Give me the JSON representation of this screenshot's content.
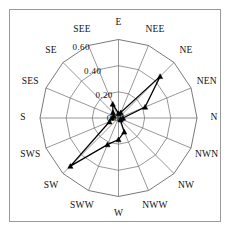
{
  "figure": {
    "background_color": "#ffffff",
    "frame_color": "#9a9a9a",
    "grid_color": "#6b6b6b",
    "series_color": "#000000"
  },
  "chart_data": {
    "type": "line",
    "subtype": "polar-radar",
    "title": "",
    "subtitle": "",
    "xlabel": "",
    "ylabel": "",
    "grid": true,
    "legend": null,
    "legend_position": "none",
    "angular_start_deg": 90,
    "angular_direction": "clockwise",
    "categories": [
      "E",
      "NEE",
      "NE",
      "NEN",
      "N",
      "NWN",
      "NW",
      "NWW",
      "W",
      "SWW",
      "SW",
      "SWS",
      "S",
      "SES",
      "SE",
      "SEE"
    ],
    "values": [
      0.035,
      0.045,
      0.45,
      0.22,
      0.035,
      0.02,
      0.02,
      0.115,
      0.165,
      0.22,
      0.52,
      0.075,
      0.05,
      0.04,
      0.06,
      0.115
    ],
    "radial_ticks": [
      "0.00",
      "0.20",
      "0.40",
      "0.60"
    ],
    "radial_tick_values": [
      0.0,
      0.2,
      0.4,
      0.6
    ],
    "rlim": [
      0.0,
      0.6
    ],
    "marker": "triangle",
    "closed": true
  },
  "axis_labels": {
    "directions": [
      {
        "name": "E",
        "text": "E"
      },
      {
        "name": "NEE",
        "text": "NEE"
      },
      {
        "name": "NE",
        "text": "NE"
      },
      {
        "name": "NEN",
        "text": "NEN"
      },
      {
        "name": "N",
        "text": "N"
      },
      {
        "name": "NWN",
        "text": "NWN"
      },
      {
        "name": "NW",
        "text": "NW"
      },
      {
        "name": "NWW",
        "text": "NWW"
      },
      {
        "name": "W",
        "text": "W"
      },
      {
        "name": "SWW",
        "text": "SWW"
      },
      {
        "name": "SW",
        "text": "SW"
      },
      {
        "name": "SWS",
        "text": "SWS"
      },
      {
        "name": "S",
        "text": "S"
      },
      {
        "name": "SES",
        "text": "SES"
      },
      {
        "name": "SE",
        "text": "SE"
      },
      {
        "name": "SEE",
        "text": "SEE"
      }
    ],
    "radial": [
      {
        "name": "r0",
        "text": "0.00"
      },
      {
        "name": "r1",
        "text": "0.20"
      },
      {
        "name": "r2",
        "text": "0.40"
      },
      {
        "name": "r3",
        "text": "0.60"
      }
    ]
  }
}
